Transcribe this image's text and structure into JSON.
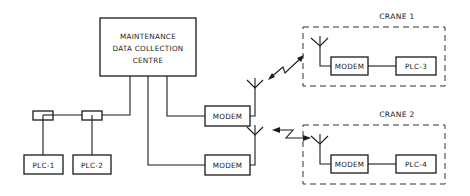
{
  "diagram": {
    "centre": {
      "lines": [
        "MAINTENANCE",
        "DATA COLLECTION",
        "CENTRE"
      ]
    },
    "local_plcs": [
      {
        "label": "PLC-1"
      },
      {
        "label": "PLC-2"
      }
    ],
    "base_modems": [
      {
        "label": "MODEM"
      },
      {
        "label": "MODEM"
      }
    ],
    "cranes": [
      {
        "title": "CRANE 1",
        "modem": "MODEM",
        "plc": "PLC-3"
      },
      {
        "title": "CRANE 2",
        "modem": "MODEM",
        "plc": "PLC-4"
      }
    ],
    "colors": {
      "line": "#1a1a1a",
      "background": "#ffffff"
    }
  }
}
